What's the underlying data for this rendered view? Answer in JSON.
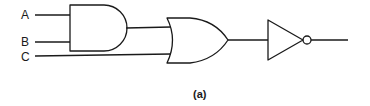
{
  "diagram": {
    "type": "logic-circuit",
    "inputs": [
      {
        "id": "A",
        "label": "A"
      },
      {
        "id": "B",
        "label": "B"
      },
      {
        "id": "C",
        "label": "C"
      }
    ],
    "gates": [
      {
        "id": "g1",
        "type": "AND",
        "inputs": [
          "A",
          "B"
        ]
      },
      {
        "id": "g2",
        "type": "OR",
        "inputs": [
          "g1",
          "C"
        ]
      },
      {
        "id": "g3",
        "type": "NOT",
        "inputs": [
          "g2"
        ]
      }
    ],
    "output": "g3",
    "caption": "(a)"
  }
}
